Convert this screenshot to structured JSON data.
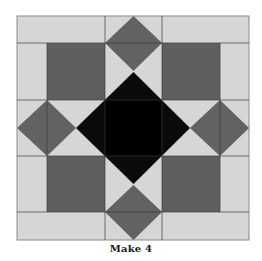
{
  "diagram": {
    "type": "quilt-block",
    "caption": "Make 4",
    "colors": {
      "background": "#d6d6d6",
      "dark_square": "#5f5f5f",
      "diamond": "#626262",
      "center": "#0a0a0a",
      "center_inner": "#000000",
      "seam": "#3a3a3a",
      "border": "#8a8a8a"
    },
    "grid": {
      "columns": [
        17,
        47,
        105,
        162,
        220,
        249
      ],
      "rows": [
        16,
        43,
        100,
        156,
        212,
        240
      ]
    },
    "elements": {
      "dark_squares": 4,
      "side_diamonds": [
        "top",
        "right",
        "bottom",
        "left"
      ],
      "center_diamond": "black"
    }
  }
}
